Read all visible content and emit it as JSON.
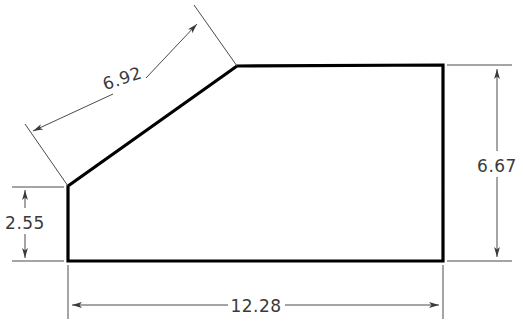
{
  "drawing": {
    "title": "2D technical part outline with linear dimensions",
    "units": "inches",
    "canvas": {
      "width": 523,
      "height": 328
    },
    "colors": {
      "background": "#ffffff",
      "outline": "#000000",
      "dimension_line": "#4a4a4a",
      "dimension_text": "#3a3a3a"
    },
    "shape": {
      "name": "chamfered-rectangle-profile",
      "vertices_px": [
        [
          68,
          186
        ],
        [
          237,
          66
        ],
        [
          443,
          65
        ],
        [
          443,
          261
        ],
        [
          68,
          261
        ]
      ],
      "outline_width_px": 3.2
    },
    "dimensions": [
      {
        "id": "slant-length",
        "label": "6.92",
        "orientation": "aligned-diagonal",
        "measures": "chamfer edge length",
        "text_x": 124,
        "text_y": 84
      },
      {
        "id": "left-height",
        "label": "2.55",
        "orientation": "vertical",
        "measures": "left vertical edge height",
        "text_x": 25,
        "text_y": 229
      },
      {
        "id": "right-height",
        "label": "6.67",
        "orientation": "vertical",
        "measures": "right vertical edge height",
        "text_x": 497,
        "text_y": 172
      },
      {
        "id": "overall-width",
        "label": "12.28",
        "orientation": "horizontal",
        "measures": "overall bottom width",
        "text_x": 255,
        "text_y": 312
      }
    ]
  }
}
